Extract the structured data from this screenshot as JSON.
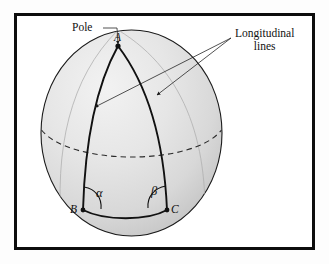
{
  "figure": {
    "frame": {
      "border_color": "#0d0d0d",
      "background": "#ffffff"
    },
    "sphere": {
      "fill_light": "#ececec",
      "fill_dark": "#cfcfcf",
      "outline_color": "#1a1a1a",
      "center_x": 131.5,
      "center_y": 133,
      "radius_x": 90.5,
      "radius_y": 103
    },
    "labels": {
      "pole": "Pole",
      "longitudinal_line1": "Longitudinal",
      "longitudinal_line2": "lines",
      "vertex_a": "A",
      "vertex_b": "B",
      "vertex_c": "C",
      "angle_alpha": "α",
      "angle_beta": "β"
    },
    "points": {
      "a": {
        "x": 118,
        "y": 46
      },
      "b": {
        "x": 83,
        "y": 210
      },
      "c": {
        "x": 167,
        "y": 210
      }
    },
    "elements": {
      "equator": "dashed-arc",
      "meridian_left": "longitudinal-line-left",
      "meridian_right": "longitudinal-line-right",
      "base_arc": "arc-BC",
      "pole_leader": "leader-line-pole",
      "longitudinal_leader_left": "leader-line-longitudinal-left",
      "longitudinal_leader_right": "leader-line-longitudinal-right"
    }
  }
}
